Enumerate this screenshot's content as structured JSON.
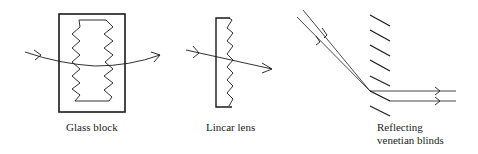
{
  "diagrams": [
    {
      "id": "glass-block",
      "label": "Glass block"
    },
    {
      "id": "linear-lens",
      "label": "Lincar lens"
    },
    {
      "id": "venetian-blinds",
      "label_line1": "Reflecting",
      "label_line2": "venetian blinds"
    }
  ],
  "colors": {
    "stroke": "#1a1a1a",
    "background": "#ffffff"
  }
}
